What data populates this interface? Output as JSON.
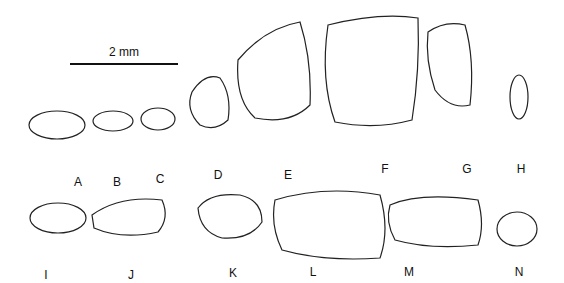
{
  "scale_bar": {
    "label": "2 mm"
  },
  "specimens": [
    {
      "label": "A",
      "x": 78,
      "y": 175
    },
    {
      "label": "B",
      "x": 117,
      "y": 175
    },
    {
      "label": "C",
      "x": 160,
      "y": 172
    },
    {
      "label": "D",
      "x": 218,
      "y": 168
    },
    {
      "label": "E",
      "x": 288,
      "y": 168
    },
    {
      "label": "F",
      "x": 385,
      "y": 162
    },
    {
      "label": "G",
      "x": 467,
      "y": 162
    },
    {
      "label": "H",
      "x": 521,
      "y": 162
    },
    {
      "label": "I",
      "x": 46,
      "y": 268
    },
    {
      "label": "J",
      "x": 131,
      "y": 268
    },
    {
      "label": "K",
      "x": 233,
      "y": 266
    },
    {
      "label": "L",
      "x": 313,
      "y": 265
    },
    {
      "label": "M",
      "x": 409,
      "y": 265
    },
    {
      "label": "N",
      "x": 519,
      "y": 265
    }
  ]
}
